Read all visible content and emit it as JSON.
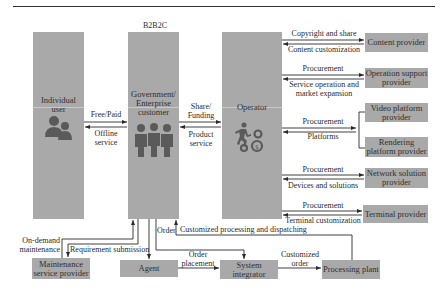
{
  "header": {
    "model_label": "B2B2C"
  },
  "actors": {
    "individual_user": "Individual user",
    "government": "Government/ Enterprise customer",
    "operator": "Operator"
  },
  "providers": {
    "content": "Content provider",
    "operation_support": "Operation support provider",
    "video_platform": "Video platform provider",
    "rendering_platform": "Rendering platform provider",
    "network_solution": "Network solution provider",
    "terminal": "Terminal provider"
  },
  "bottom_nodes": {
    "maintenance": "Maintenance service provider",
    "agent": "Agent",
    "system_integrator": "System integrator",
    "processing_plant": "Processing plant"
  },
  "flows": {
    "free_paid": "Free/Paid",
    "offline_service": "Offline service",
    "share_funding": "Share/ Funding",
    "product_service": "Product service",
    "copyright_share": "Copyright and share",
    "content_customization": "Content customization",
    "procurement_1": "Procurement",
    "service_operation": "Service operation and market expansion",
    "procurement_2": "Procurement",
    "platforms": "Platforms",
    "procurement_3": "Procurement",
    "devices_solutions": "Devices and solutions",
    "procurement_4": "Procurement",
    "terminal_customization": "Terminal customization",
    "customized_processing": "Customized processing and dispatching",
    "on_demand_maintenance": "On-demand maintenance",
    "requirement_submission": "Requirement submission",
    "order": "Order",
    "order_placement": "Order placement",
    "customized_order": "Customized order"
  },
  "icons": {
    "individual": "users-icon",
    "government": "business-people-icon",
    "operator": "runner-gears-icon"
  },
  "colors": {
    "box": "#a9a9a9",
    "line": "#2a2a2a",
    "icon": "#555555"
  }
}
